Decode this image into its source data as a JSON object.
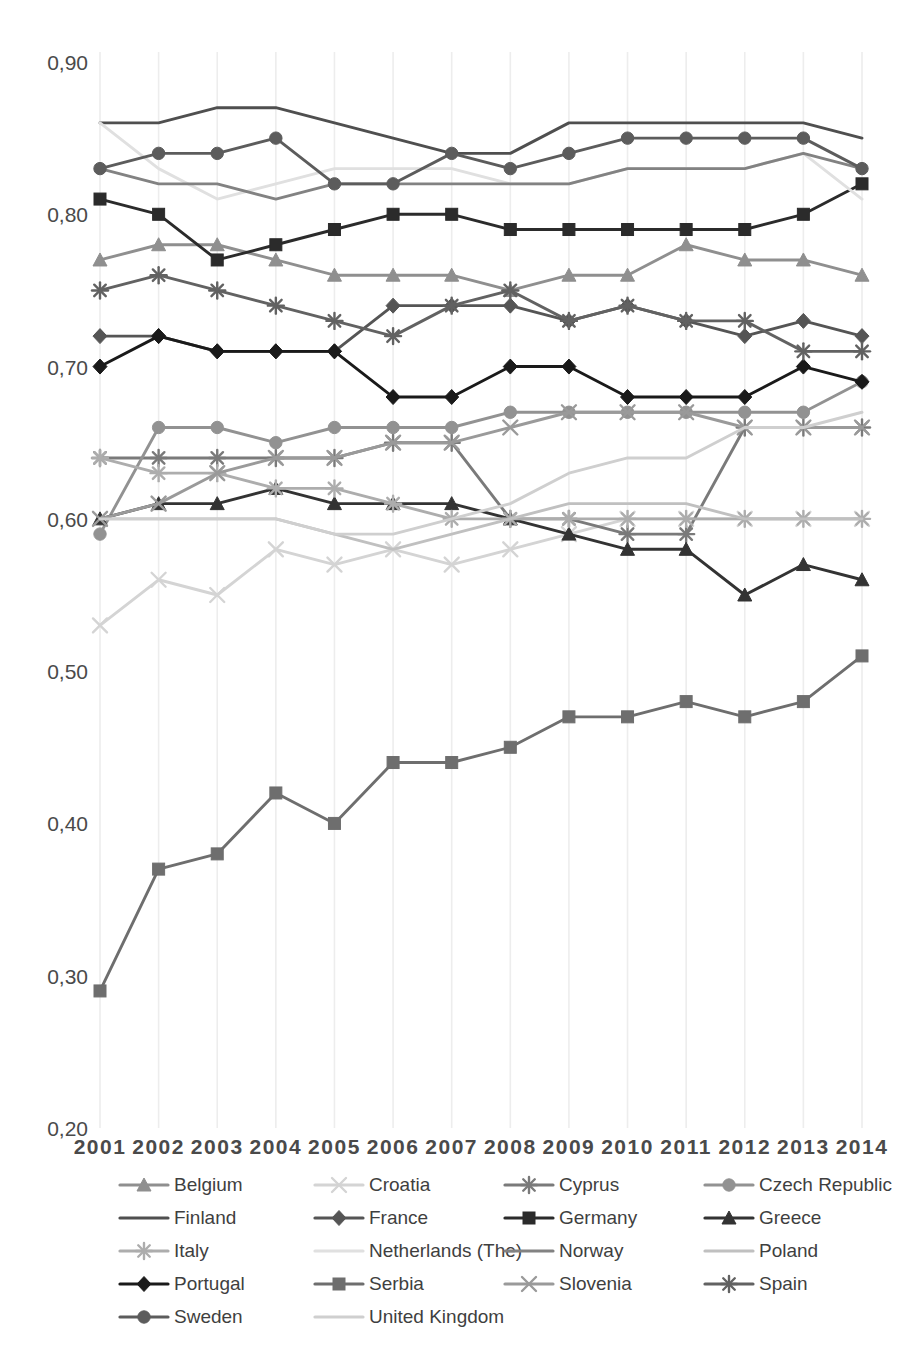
{
  "chart_data": {
    "type": "line",
    "title": "",
    "subtitle": "",
    "xlabel": "",
    "ylabel": "",
    "grid": "vertical-only",
    "legend_position": "bottom",
    "x": [
      2001,
      2002,
      2003,
      2004,
      2005,
      2006,
      2007,
      2008,
      2009,
      2010,
      2011,
      2012,
      2013,
      2014
    ],
    "categories": [
      "2001",
      "2002",
      "2003",
      "2004",
      "2005",
      "2006",
      "2007",
      "2008",
      "2009",
      "2010",
      "2011",
      "2012",
      "2013",
      "2014"
    ],
    "ylim": [
      0.2,
      0.9
    ],
    "ytick_labels": [
      "0,90",
      "0,80",
      "0,70",
      "0,60",
      "0,50",
      "0,40",
      "0,30",
      "0,20"
    ],
    "ytick_values": [
      0.9,
      0.8,
      0.7,
      0.6,
      0.5,
      0.4,
      0.3,
      0.2
    ],
    "series": [
      {
        "name": "Belgium",
        "marker": "triangle",
        "color": "#8f8f8f",
        "values": [
          0.77,
          0.78,
          0.78,
          0.77,
          0.76,
          0.76,
          0.76,
          0.75,
          0.76,
          0.76,
          0.78,
          0.77,
          0.77,
          0.76
        ]
      },
      {
        "name": "Croatia",
        "marker": "x",
        "color": "#d4d4d4",
        "values": [
          0.53,
          0.56,
          0.55,
          0.58,
          0.57,
          0.58,
          0.57,
          0.58,
          0.59,
          0.6,
          0.6,
          0.6,
          0.6,
          0.6
        ]
      },
      {
        "name": "Cyprus",
        "marker": "asterisk",
        "color": "#7a7a7a",
        "values": [
          0.64,
          0.64,
          0.64,
          0.64,
          0.64,
          0.65,
          0.65,
          0.6,
          0.6,
          0.59,
          0.59,
          0.66,
          0.66,
          0.66
        ]
      },
      {
        "name": "Czech Republic",
        "marker": "circle",
        "color": "#929292",
        "values": [
          0.59,
          0.66,
          0.66,
          0.65,
          0.66,
          0.66,
          0.66,
          0.67,
          0.67,
          0.67,
          0.67,
          0.67,
          0.67,
          0.69
        ]
      },
      {
        "name": "Finland",
        "marker": "none",
        "color": "#4f4f4f",
        "values": [
          0.86,
          0.86,
          0.87,
          0.87,
          0.86,
          0.85,
          0.84,
          0.84,
          0.86,
          0.86,
          0.86,
          0.86,
          0.86,
          0.85
        ]
      },
      {
        "name": "France",
        "marker": "diamond",
        "color": "#555555",
        "values": [
          0.72,
          0.72,
          0.71,
          0.71,
          0.71,
          0.74,
          0.74,
          0.74,
          0.73,
          0.74,
          0.73,
          0.72,
          0.73,
          0.72
        ]
      },
      {
        "name": "Germany",
        "marker": "square",
        "color": "#2b2b2b",
        "values": [
          0.81,
          0.8,
          0.77,
          0.78,
          0.79,
          0.8,
          0.8,
          0.79,
          0.79,
          0.79,
          0.79,
          0.79,
          0.8,
          0.82
        ]
      },
      {
        "name": "Greece",
        "marker": "triangle",
        "color": "#333333",
        "values": [
          0.6,
          0.61,
          0.61,
          0.62,
          0.61,
          0.61,
          0.61,
          0.6,
          0.59,
          0.58,
          0.58,
          0.55,
          0.57,
          0.56
        ]
      },
      {
        "name": "Italy",
        "marker": "asterisk",
        "color": "#adadad",
        "values": [
          0.64,
          0.63,
          0.63,
          0.62,
          0.62,
          0.61,
          0.6,
          0.6,
          0.6,
          0.6,
          0.6,
          0.6,
          0.6,
          0.6
        ]
      },
      {
        "name": "Netherlands (The)",
        "marker": "none",
        "color": "#e0e0e0",
        "values": [
          0.86,
          0.83,
          0.81,
          0.82,
          0.83,
          0.83,
          0.83,
          0.82,
          0.82,
          0.83,
          0.83,
          0.83,
          0.84,
          0.81
        ]
      },
      {
        "name": "Norway",
        "marker": "none",
        "color": "#828282",
        "values": [
          0.83,
          0.82,
          0.82,
          0.81,
          0.82,
          0.82,
          0.82,
          0.82,
          0.82,
          0.83,
          0.83,
          0.83,
          0.84,
          0.83
        ]
      },
      {
        "name": "Poland",
        "marker": "none",
        "color": "#c0c0c0",
        "values": [
          0.6,
          0.6,
          0.6,
          0.6,
          0.59,
          0.58,
          0.59,
          0.6,
          0.61,
          0.61,
          0.61,
          0.6,
          0.6,
          0.6
        ]
      },
      {
        "name": "Portugal",
        "marker": "diamond",
        "color": "#1a1a1a",
        "values": [
          0.7,
          0.72,
          0.71,
          0.71,
          0.71,
          0.68,
          0.68,
          0.7,
          0.7,
          0.68,
          0.68,
          0.68,
          0.7,
          0.69
        ]
      },
      {
        "name": "Serbia",
        "marker": "square",
        "color": "#6e6e6e",
        "values": [
          0.29,
          0.37,
          0.38,
          0.42,
          0.4,
          0.44,
          0.44,
          0.45,
          0.47,
          0.47,
          0.48,
          0.47,
          0.48,
          0.51
        ]
      },
      {
        "name": "Slovenia",
        "marker": "x",
        "color": "#9a9a9a",
        "values": [
          0.6,
          0.61,
          0.63,
          0.64,
          0.64,
          0.65,
          0.65,
          0.66,
          0.67,
          0.67,
          0.67,
          0.66,
          0.66,
          0.66
        ]
      },
      {
        "name": "Spain",
        "marker": "asterisk",
        "color": "#626262",
        "values": [
          0.75,
          0.76,
          0.75,
          0.74,
          0.73,
          0.72,
          0.74,
          0.75,
          0.73,
          0.74,
          0.73,
          0.73,
          0.71,
          0.71
        ]
      },
      {
        "name": "Sweden",
        "marker": "circle",
        "color": "#5c5c5c",
        "values": [
          0.83,
          0.84,
          0.84,
          0.85,
          0.82,
          0.82,
          0.84,
          0.83,
          0.84,
          0.85,
          0.85,
          0.85,
          0.85,
          0.83
        ]
      },
      {
        "name": "United Kingdom",
        "marker": "none",
        "color": "#cfcfcf",
        "values": [
          0.6,
          0.6,
          0.6,
          0.6,
          0.59,
          0.59,
          0.6,
          0.61,
          0.63,
          0.64,
          0.64,
          0.66,
          0.66,
          0.67
        ]
      }
    ]
  },
  "legend": {
    "rows": [
      [
        "Belgium",
        "Croatia",
        "Cyprus",
        "Czech Republic"
      ],
      [
        "Finland",
        "France",
        "Germany",
        "Greece"
      ],
      [
        "Italy",
        "Netherlands (The)",
        "Norway",
        "Poland"
      ],
      [
        "Portugal",
        "Serbia",
        "Slovenia",
        "Spain"
      ],
      [
        "Sweden",
        "United Kingdom"
      ]
    ]
  },
  "axis": {
    "y_labels": [
      "0,90",
      "0,80",
      "0,70",
      "0,60",
      "0,50",
      "0,40",
      "0,30",
      "0,20"
    ],
    "x_labels": [
      "2001",
      "2002",
      "2003",
      "2004",
      "2005",
      "2006",
      "2007",
      "2008",
      "2009",
      "2010",
      "2011",
      "2012",
      "2013",
      "2014"
    ]
  },
  "colors": {
    "gridline": "#ededed",
    "tick_text": "#4a4a4a",
    "background": "#ffffff"
  }
}
